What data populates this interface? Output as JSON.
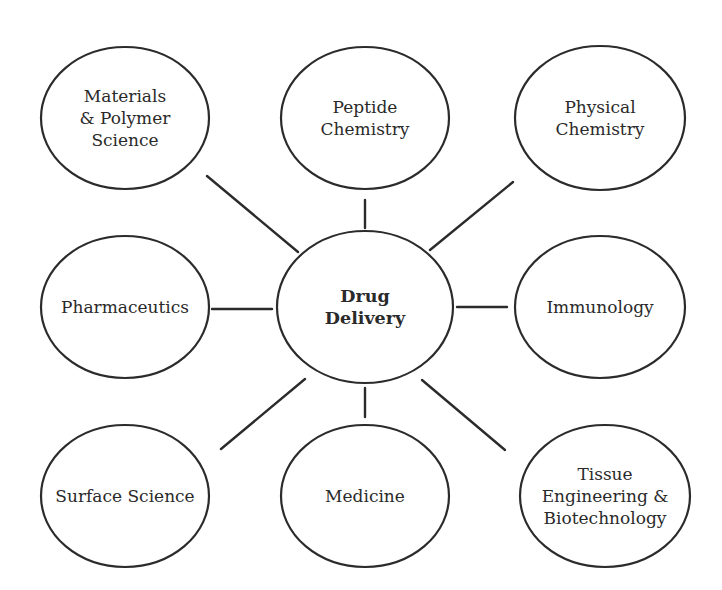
{
  "diagram": {
    "type": "hub-and-spoke",
    "center": {
      "id": "drug-delivery",
      "lines": [
        "Drug",
        "Delivery"
      ],
      "cx": 365,
      "cy": 307,
      "rx": 88,
      "ry": 76
    },
    "nodes": [
      {
        "id": "materials-polymer-science",
        "lines": [
          "Materials",
          "& Polymer",
          "Science"
        ],
        "cx": 125,
        "cy": 118,
        "rx": 84,
        "ry": 71
      },
      {
        "id": "peptide-chemistry",
        "lines": [
          "Peptide",
          "Chemistry"
        ],
        "cx": 365,
        "cy": 118,
        "rx": 84,
        "ry": 71
      },
      {
        "id": "physical-chemistry",
        "lines": [
          "Physical",
          "Chemistry"
        ],
        "cx": 600,
        "cy": 118,
        "rx": 85,
        "ry": 72
      },
      {
        "id": "pharmaceutics",
        "lines": [
          "Pharmaceutics"
        ],
        "cx": 125,
        "cy": 307,
        "rx": 84,
        "ry": 71
      },
      {
        "id": "immunology",
        "lines": [
          "Immunology"
        ],
        "cx": 600,
        "cy": 307,
        "rx": 85,
        "ry": 71
      },
      {
        "id": "surface-science",
        "lines": [
          "Surface Science"
        ],
        "cx": 125,
        "cy": 496,
        "rx": 84,
        "ry": 71
      },
      {
        "id": "medicine",
        "lines": [
          "Medicine"
        ],
        "cx": 365,
        "cy": 496,
        "rx": 84,
        "ry": 71
      },
      {
        "id": "tissue-engineering-biotechnology",
        "lines": [
          "Tissue",
          "Engineering &",
          "Biotechnology"
        ],
        "cx": 605,
        "cy": 496,
        "rx": 85,
        "ry": 71
      }
    ],
    "links": [
      {
        "to": "materials-polymer-science",
        "x1": 298,
        "y1": 252,
        "x2": 207,
        "y2": 176
      },
      {
        "to": "peptide-chemistry",
        "x1": 365,
        "y1": 228,
        "x2": 365,
        "y2": 200
      },
      {
        "to": "physical-chemistry",
        "x1": 430,
        "y1": 250,
        "x2": 513,
        "y2": 182
      },
      {
        "to": "pharmaceutics",
        "x1": 272,
        "y1": 309,
        "x2": 212,
        "y2": 309
      },
      {
        "to": "immunology",
        "x1": 457,
        "y1": 307,
        "x2": 507,
        "y2": 307
      },
      {
        "to": "surface-science",
        "x1": 305,
        "y1": 379,
        "x2": 221,
        "y2": 449
      },
      {
        "to": "medicine",
        "x1": 365,
        "y1": 388,
        "x2": 365,
        "y2": 417
      },
      {
        "to": "tissue-engineering-biotechnology",
        "x1": 422,
        "y1": 380,
        "x2": 505,
        "y2": 450
      }
    ],
    "colors": {
      "stroke": "#2b2b2b",
      "text": "#2a2a2a",
      "background": "#ffffff"
    }
  }
}
